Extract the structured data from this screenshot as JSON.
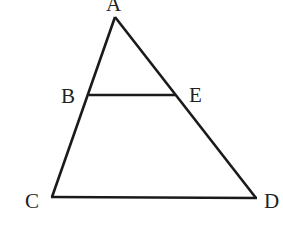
{
  "diagram": {
    "type": "geometry-triangle",
    "points": {
      "A": {
        "label": "A",
        "x": 115,
        "y": 17
      },
      "B": {
        "label": "B",
        "x": 89,
        "y": 95
      },
      "E": {
        "label": "E",
        "x": 175,
        "y": 95
      },
      "C": {
        "label": "C",
        "x": 52,
        "y": 197
      },
      "D": {
        "label": "D",
        "x": 256,
        "y": 198
      }
    },
    "segments": [
      "AC",
      "AD",
      "CD",
      "BE"
    ],
    "stroke_color": "#1a1a1a"
  }
}
